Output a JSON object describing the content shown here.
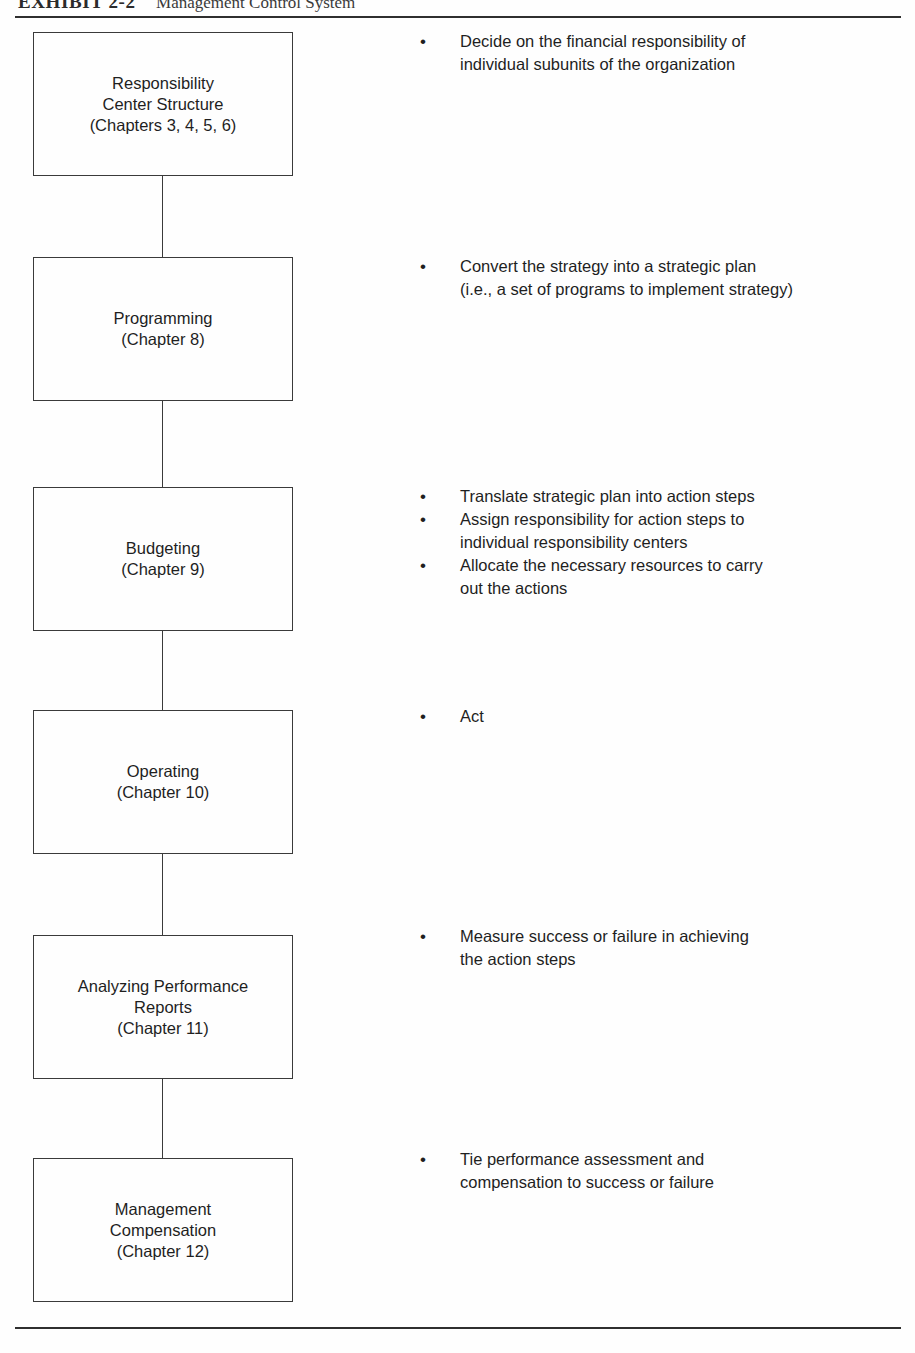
{
  "header": {
    "exhibit_label": "EXHIBIT 2-2",
    "exhibit_title": "Management Control System"
  },
  "bullet_glyph": "•",
  "stages": [
    {
      "box_label": "Responsibility\nCenter Structure\n(Chapters 3, 4, 5, 6)",
      "box_name": "responsibility-center-structure",
      "bullets": [
        "Decide on the financial responsibility of\nindividual subunits of the organization"
      ]
    },
    {
      "box_label": "Programming\n(Chapter 8)",
      "box_name": "programming",
      "bullets": [
        "Convert the strategy into a strategic plan\n(i.e., a set of programs to implement strategy)"
      ]
    },
    {
      "box_label": "Budgeting\n(Chapter 9)",
      "box_name": "budgeting",
      "bullets": [
        "Translate strategic plan into action steps",
        "Assign responsibility for action steps to\nindividual responsibility centers",
        "Allocate the necessary resources to carry\nout the actions"
      ]
    },
    {
      "box_label": "Operating\n(Chapter 10)",
      "box_name": "operating",
      "bullets": [
        "Act"
      ]
    },
    {
      "box_label": "Analyzing Performance\nReports\n(Chapter 11)",
      "box_name": "analyzing-performance-reports",
      "bullets": [
        "Measure success or failure in achieving\nthe action steps"
      ]
    },
    {
      "box_label": "Management\nCompensation\n(Chapter 12)",
      "box_name": "management-compensation",
      "bullets": [
        "Tie performance assessment and\ncompensation to success or failure"
      ]
    }
  ],
  "layout": {
    "box_tops": [
      32,
      257,
      487,
      710,
      935,
      1158
    ],
    "box_heights": [
      144,
      144,
      144,
      144,
      144,
      144
    ],
    "bullet_tops": [
      30,
      255,
      485,
      705,
      925,
      1148
    ]
  }
}
